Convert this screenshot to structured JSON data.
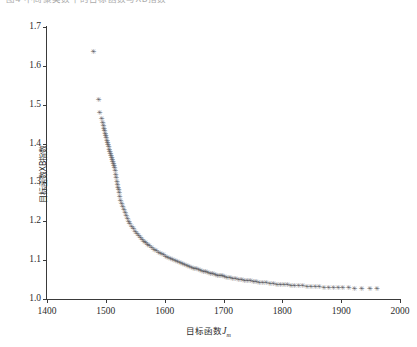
{
  "caption": {
    "text": "图4  不同聚类数下的目标函数与XB指数"
  },
  "axes": {
    "y_ticks": [
      "1.0",
      "1.1",
      "1.2",
      "1.3",
      "1.4",
      "1.5",
      "1.6",
      "1.7"
    ],
    "x_ticks": [
      "1400",
      "1500",
      "1600",
      "1700",
      "1800",
      "1900",
      "2000"
    ],
    "ylabel": "目标函数XB指数",
    "xlabel_main": "目标函数",
    "xlabel_var": "J",
    "xlabel_sub": "m"
  },
  "style": {
    "marker_color": "#55555a",
    "axis_color": "#3a3a3a",
    "background": "#ffffff",
    "marker_glyph": "✳"
  },
  "chart_data": {
    "type": "scatter",
    "title": "",
    "xlabel": "目标函数Jm",
    "ylabel": "目标函数XB指数",
    "xlim": [
      1400,
      2000
    ],
    "ylim": [
      1.0,
      1.7
    ],
    "xticks": [
      1400,
      1500,
      1600,
      1700,
      1800,
      1900,
      2000
    ],
    "yticks": [
      1.0,
      1.1,
      1.2,
      1.3,
      1.4,
      1.5,
      1.6,
      1.7
    ],
    "grid": false,
    "legend": null,
    "marker": "asterisk",
    "series": [
      {
        "name": "XB指数",
        "x": [
          1478,
          1487,
          1489,
          1492,
          1494,
          1495,
          1496,
          1497,
          1498,
          1499,
          1500,
          1501,
          1502,
          1503,
          1504,
          1505,
          1506,
          1507,
          1508,
          1509,
          1510,
          1511,
          1512,
          1513,
          1514,
          1515,
          1516,
          1517,
          1518,
          1519,
          1520,
          1521,
          1522,
          1523,
          1524,
          1526,
          1528,
          1530,
          1532,
          1534,
          1536,
          1538,
          1540,
          1543,
          1546,
          1549,
          1552,
          1555,
          1558,
          1561,
          1564,
          1567,
          1570,
          1573,
          1577,
          1581,
          1585,
          1589,
          1593,
          1597,
          1601,
          1605,
          1609,
          1613,
          1617,
          1621,
          1625,
          1629,
          1633,
          1637,
          1641,
          1645,
          1649,
          1653,
          1657,
          1661,
          1665,
          1669,
          1673,
          1677,
          1681,
          1685,
          1689,
          1693,
          1697,
          1701,
          1705,
          1710,
          1715,
          1720,
          1725,
          1730,
          1735,
          1740,
          1745,
          1750,
          1755,
          1760,
          1766,
          1772,
          1778,
          1784,
          1790,
          1796,
          1802,
          1808,
          1814,
          1820,
          1827,
          1834,
          1841,
          1848,
          1855,
          1862,
          1870,
          1878,
          1886,
          1894,
          1902,
          1912,
          1922,
          1934,
          1948,
          1960
        ],
        "y": [
          1.635,
          1.512,
          1.478,
          1.462,
          1.452,
          1.444,
          1.437,
          1.43,
          1.424,
          1.418,
          1.412,
          1.406,
          1.4,
          1.394,
          1.389,
          1.383,
          1.378,
          1.372,
          1.367,
          1.362,
          1.356,
          1.351,
          1.346,
          1.341,
          1.336,
          1.327,
          1.318,
          1.309,
          1.301,
          1.293,
          1.285,
          1.278,
          1.271,
          1.261,
          1.252,
          1.243,
          1.235,
          1.227,
          1.219,
          1.212,
          1.205,
          1.198,
          1.192,
          1.185,
          1.178,
          1.172,
          1.166,
          1.161,
          1.156,
          1.151,
          1.146,
          1.142,
          1.138,
          1.134,
          1.13,
          1.126,
          1.122,
          1.118,
          1.115,
          1.111,
          1.108,
          1.105,
          1.102,
          1.099,
          1.096,
          1.093,
          1.091,
          1.088,
          1.086,
          1.083,
          1.081,
          1.079,
          1.077,
          1.075,
          1.073,
          1.071,
          1.069,
          1.067,
          1.066,
          1.064,
          1.062,
          1.061,
          1.059,
          1.058,
          1.057,
          1.055,
          1.054,
          1.052,
          1.051,
          1.05,
          1.048,
          1.047,
          1.046,
          1.045,
          1.044,
          1.043,
          1.042,
          1.041,
          1.04,
          1.039,
          1.038,
          1.037,
          1.036,
          1.035,
          1.034,
          1.034,
          1.033,
          1.032,
          1.032,
          1.031,
          1.03,
          1.03,
          1.029,
          1.029,
          1.028,
          1.028,
          1.027,
          1.027,
          1.026,
          1.026,
          1.025,
          1.025,
          1.024,
          1.024
        ]
      }
    ]
  }
}
